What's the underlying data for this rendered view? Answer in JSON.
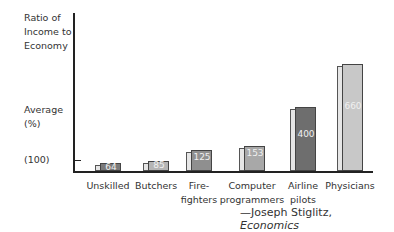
{
  "chart_data": {
    "type": "bar",
    "title": "",
    "ylabel": "Ratio of Income to Economy Average (%)",
    "ylabel_lines": [
      "Ratio of",
      "Income to",
      "Economy",
      "",
      "",
      "Average",
      "(%)"
    ],
    "reference_tick_label": "(100)",
    "reference_value": 100,
    "categories": [
      "Unskilled",
      "Butchers",
      "Fire-fighters",
      "Computer programmers",
      "Airline pilots",
      "Physicians"
    ],
    "category_lines": [
      [
        "Unskilled"
      ],
      [
        "Butchers"
      ],
      [
        "Fire-",
        "fighters"
      ],
      [
        "Computer",
        "programmers"
      ],
      [
        "Airline",
        "pilots"
      ],
      [
        "Physicians"
      ]
    ],
    "values": [
      64,
      85,
      125,
      153,
      400,
      660
    ],
    "value_labels": [
      "64",
      "85",
      "125",
      "153",
      "400",
      "660"
    ],
    "bar_colors": [
      "#7a7a7a",
      "#b5b5b5",
      "#8f8f8f",
      "#a8a8a8",
      "#6e6e6e",
      "#c8c8c8"
    ],
    "source": "—Joseph Stiglitz, Economics",
    "legend": null,
    "grid": false
  },
  "labels": {
    "y1": "Ratio of",
    "y2": "Income to",
    "y3": "Economy",
    "y4": "Average",
    "y5": "(%)",
    "ref": "(100)"
  },
  "source": {
    "prefix": "—Joseph Stiglitz, ",
    "work": "Economics"
  }
}
